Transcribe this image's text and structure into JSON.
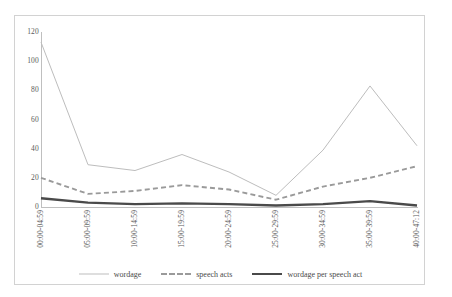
{
  "chart_data": {
    "type": "line",
    "title": "",
    "subtitle": "",
    "xlabel": "",
    "ylabel": "",
    "ylim": [
      0,
      120
    ],
    "yticks": [
      0,
      20,
      40,
      60,
      80,
      100,
      120
    ],
    "grid": false,
    "legend_position": "bottom",
    "categories": [
      "00:00-04:59",
      "05:00-09:59",
      "10:00-14:59",
      "15:00-19:59",
      "20:00-24:59",
      "25:00-29:59",
      "30:00-34:59",
      "35:00-39:59",
      "40:00-47:12"
    ],
    "series": [
      {
        "name": "wordage",
        "style": "thin-solid",
        "color": "#bdbdbd",
        "values": [
          113,
          29,
          25,
          36,
          24,
          8,
          39,
          83,
          42
        ]
      },
      {
        "name": "speech acts",
        "style": "dashed",
        "color": "#9a9a9a",
        "values": [
          20,
          9,
          11,
          15,
          12,
          5,
          14,
          20,
          28
        ]
      },
      {
        "name": "wordage per speech act",
        "style": "thick-solid",
        "color": "#4a4a4a",
        "values": [
          6,
          3,
          2,
          2.5,
          2,
          1,
          2,
          4,
          1
        ]
      }
    ]
  },
  "legend": {
    "items": [
      {
        "label": "wordage"
      },
      {
        "label": "speech acts"
      },
      {
        "label": "wordage per speech act"
      }
    ]
  },
  "colors": {
    "frame": "#d2d2d2",
    "axis": "#bfbfbf",
    "tick_text": "#5a5a5a",
    "wordage": "#bdbdbd",
    "speech_acts": "#9a9a9a",
    "ratio": "#4a4a4a"
  }
}
